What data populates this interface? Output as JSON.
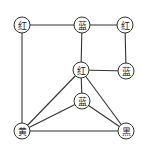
{
  "graph": {
    "type": "undirected-graph",
    "node_radius": 8,
    "colors": {
      "stroke": "#333333",
      "fill": "#ffffff",
      "text": "#222222"
    },
    "nodes": [
      {
        "id": "n1",
        "label": "红",
        "x": 22,
        "y": 25
      },
      {
        "id": "n2",
        "label": "蓝",
        "x": 82,
        "y": 25
      },
      {
        "id": "n3",
        "label": "红",
        "x": 125,
        "y": 25
      },
      {
        "id": "n4",
        "label": "红",
        "x": 81,
        "y": 70
      },
      {
        "id": "n5",
        "label": "蓝",
        "x": 126,
        "y": 71
      },
      {
        "id": "n6",
        "label": "蓝",
        "x": 82,
        "y": 101
      },
      {
        "id": "n7",
        "label": "黄",
        "x": 22,
        "y": 131
      },
      {
        "id": "n8",
        "label": "黑",
        "x": 126,
        "y": 131
      }
    ],
    "edges": [
      [
        "n1",
        "n2"
      ],
      [
        "n2",
        "n3"
      ],
      [
        "n3",
        "n5"
      ],
      [
        "n2",
        "n4"
      ],
      [
        "n4",
        "n5"
      ],
      [
        "n1",
        "n7"
      ],
      [
        "n4",
        "n7"
      ],
      [
        "n4",
        "n6"
      ],
      [
        "n4",
        "n8"
      ],
      [
        "n6",
        "n7"
      ],
      [
        "n6",
        "n8"
      ],
      [
        "n7",
        "n8"
      ]
    ]
  }
}
